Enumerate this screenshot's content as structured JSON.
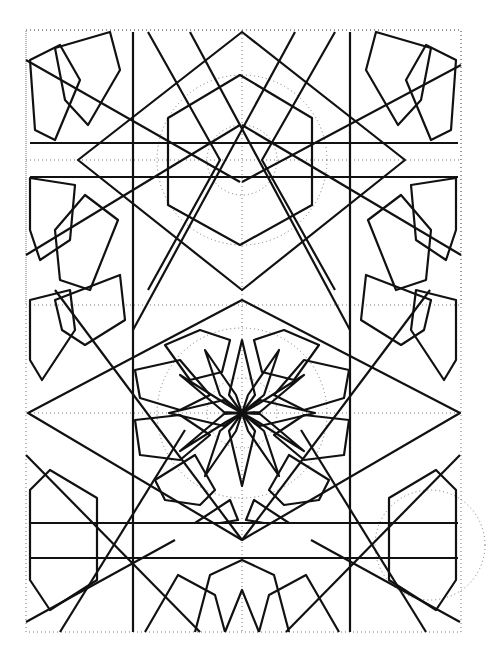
{
  "figure": {
    "colors": {
      "line": "#111111",
      "guide": "#777777",
      "background": "#ffffff"
    }
  }
}
